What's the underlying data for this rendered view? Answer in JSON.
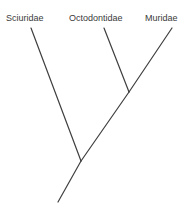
{
  "figure": {
    "type": "cladogram",
    "background_color": "#ffffff",
    "line_color": "#3f3f3f",
    "line_width": 1.2,
    "width": 191,
    "height": 207
  },
  "labels": [
    {
      "id": "sciuridae",
      "text": "Sciuridae"
    },
    {
      "id": "octodontidae",
      "text": "Octodontidae"
    },
    {
      "id": "muridae",
      "text": "Muridae"
    }
  ],
  "chart_data": {
    "type": "diagram",
    "subtype": "cladogram",
    "title": "",
    "taxa": [
      "Sciuridae",
      "Octodontidae",
      "Muridae"
    ],
    "topology": "(Sciuridae,(Octodontidae,Muridae));",
    "nodes": [
      {
        "id": "tip-sciuridae",
        "label": "Sciuridae",
        "x": 31,
        "y": 28
      },
      {
        "id": "tip-octodontidae",
        "label": "Octodontidae",
        "x": 104,
        "y": 28
      },
      {
        "id": "tip-muridae",
        "label": "Muridae",
        "x": 172,
        "y": 28
      },
      {
        "id": "node-crown",
        "label": "",
        "x": 129,
        "y": 92
      },
      {
        "id": "node-basal",
        "label": "",
        "x": 81,
        "y": 161
      },
      {
        "id": "root-tip",
        "label": "",
        "x": 58,
        "y": 202
      }
    ],
    "branches": [
      {
        "name": "branch-sciuridae",
        "from": [
          31,
          28
        ],
        "to": [
          81,
          161
        ]
      },
      {
        "name": "branch-octodontidae",
        "from": [
          104,
          28
        ],
        "to": [
          129,
          92
        ]
      },
      {
        "name": "branch-muridae",
        "from": [
          172,
          28
        ],
        "to": [
          129,
          92
        ]
      },
      {
        "name": "branch-crown-stem",
        "from": [
          129,
          92
        ],
        "to": [
          81,
          161
        ]
      },
      {
        "name": "branch-root-stem",
        "from": [
          81,
          161
        ],
        "to": [
          58,
          202
        ]
      }
    ],
    "legend": [],
    "grid": false,
    "axes": false
  }
}
